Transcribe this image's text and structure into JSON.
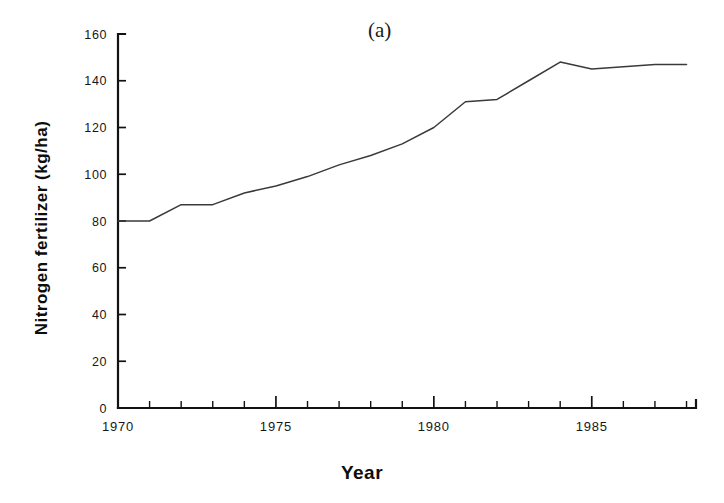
{
  "figure": {
    "panel_label": "(a)",
    "background_color": "#ffffff",
    "line_color": "#3a3a3a",
    "axis_color": "#121212"
  },
  "chart_data": {
    "type": "line",
    "title": "(a)",
    "xlabel": "Year",
    "ylabel": "Nitrogen fertilizer (kg/ha)",
    "xlim": [
      1970,
      1988.3
    ],
    "ylim": [
      0,
      160
    ],
    "grid": false,
    "legend": null,
    "y_ticks": [
      0,
      20,
      40,
      60,
      80,
      100,
      120,
      140,
      160
    ],
    "y_tick_labels": [
      "0",
      "20",
      "40",
      "60",
      "80",
      "100",
      "120",
      "140",
      "160"
    ],
    "x_ticks": [
      1970,
      1975,
      1980,
      1985
    ],
    "x_tick_labels": [
      "1970",
      "1975",
      "1980",
      "1985"
    ],
    "x_minor_ticks": [
      1971,
      1972,
      1973,
      1974,
      1976,
      1977,
      1978,
      1979,
      1981,
      1982,
      1983,
      1984,
      1986,
      1987,
      1988
    ],
    "series": [
      {
        "name": "Nitrogen fertilizer",
        "x": [
          1970,
          1971,
          1972,
          1973,
          1974,
          1975,
          1976,
          1977,
          1978,
          1979,
          1980,
          1981,
          1982,
          1983,
          1984,
          1985,
          1986,
          1987,
          1988
        ],
        "values": [
          80,
          80,
          87,
          87,
          92,
          95,
          99,
          104,
          108,
          113,
          120,
          131,
          132,
          140,
          148,
          145,
          146,
          147,
          147
        ]
      }
    ]
  }
}
